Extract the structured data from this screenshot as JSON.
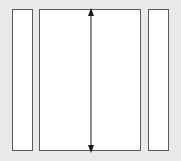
{
  "canvas": {
    "width": 181,
    "height": 161,
    "background_color": "#e9e9e9",
    "title": "Panel Height Dimension Diagram"
  },
  "style": {
    "panel_fill": "#ffffff",
    "panel_stroke": "#5a5a5a",
    "dimension_color": "#1a1a1a"
  },
  "panels": [
    {
      "id": "panel-left",
      "label": "Left Narrow Panel",
      "x": 12,
      "y": 9,
      "width": 21,
      "height": 142
    },
    {
      "id": "panel-center",
      "label": "Center Wide Panel",
      "x": 39,
      "y": 9,
      "width": 102,
      "height": 142
    },
    {
      "id": "panel-right",
      "label": "Right Narrow Panel",
      "x": 148,
      "y": 9,
      "width": 21,
      "height": 142
    }
  ],
  "dimension": {
    "id": "height-dimension",
    "label": "Height Dimension Arrow",
    "orientation": "vertical",
    "arrowheads": "both",
    "value_text": "",
    "x": 91,
    "y_top": 9,
    "y_bottom": 151,
    "length": 142
  }
}
